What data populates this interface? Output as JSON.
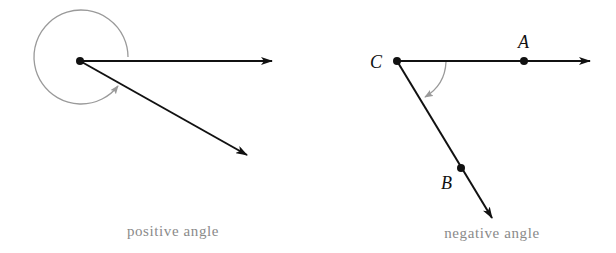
{
  "colors": {
    "ray": "#111111",
    "arc": "#9a9a9a",
    "caption": "#8a8a8a",
    "background": "#ffffff"
  },
  "diagrams": [
    {
      "id": "positive",
      "caption": "positive angle",
      "vertex_label": "",
      "points": [],
      "rays": [
        "horizontal initial side",
        "terminal side below"
      ],
      "arc_direction": "counterclockwise"
    },
    {
      "id": "negative",
      "caption": "negative angle",
      "vertex_label": "C",
      "points": [
        {
          "label": "A",
          "on": "horizontal ray"
        },
        {
          "label": "B",
          "on": "descending ray"
        }
      ],
      "arc_direction": "clockwise"
    }
  ]
}
